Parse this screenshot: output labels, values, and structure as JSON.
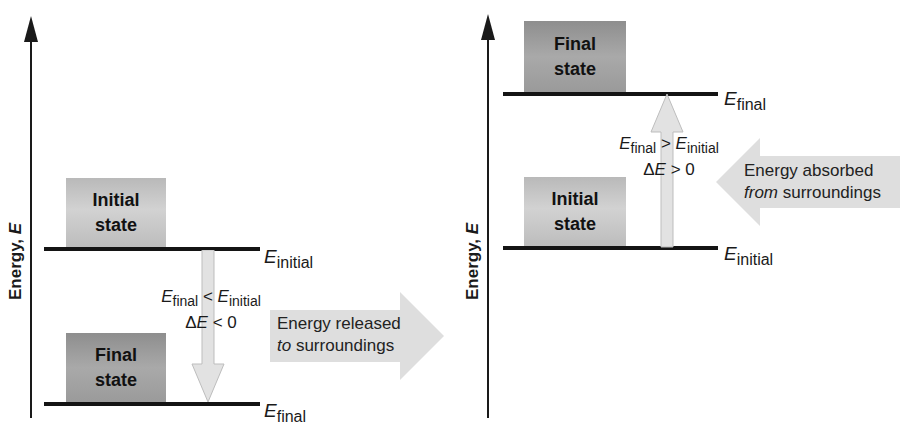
{
  "colors": {
    "axis": "#1a1a1a",
    "level_line": "#141414",
    "initial_box": "#c8c8c8",
    "final_box": "#a0a0a0",
    "transition_arrow_fill": "#e2e2e2",
    "transition_arrow_stroke": "#bdbdbd",
    "surroundings_arrow_fill": "#dedede"
  },
  "left_panel": {
    "axis_label_prefix": "Energy, ",
    "axis_label_symbol": "E",
    "initial_box": {
      "line1": "Initial",
      "line2": "state"
    },
    "final_box": {
      "line1": "Final",
      "line2": "state"
    },
    "initial_level": {
      "symbol": "E",
      "subscript": "initial"
    },
    "final_level": {
      "symbol": "E",
      "subscript": "final"
    },
    "relation": {
      "lhs_symbol": "E",
      "lhs_sub": "final",
      "operator": " < ",
      "rhs_symbol": "E",
      "rhs_sub": "initial",
      "delta_prefix": "Δ",
      "delta_symbol": "E",
      "delta_rest": " < 0"
    },
    "surroundings_arrow": {
      "direction": "right",
      "line1": "Energy released",
      "line2_italic": "to",
      "line2_rest": " surroundings"
    }
  },
  "right_panel": {
    "axis_label_prefix": "Energy, ",
    "axis_label_symbol": "E",
    "final_box": {
      "line1": "Final",
      "line2": "state"
    },
    "initial_box": {
      "line1": "Initial",
      "line2": "state"
    },
    "final_level": {
      "symbol": "E",
      "subscript": "final"
    },
    "initial_level": {
      "symbol": "E",
      "subscript": "initial"
    },
    "relation": {
      "lhs_symbol": "E",
      "lhs_sub": "final",
      "operator": " > ",
      "rhs_symbol": "E",
      "rhs_sub": "initial",
      "delta_prefix": "Δ",
      "delta_symbol": "E",
      "delta_rest": " > 0"
    },
    "surroundings_arrow": {
      "direction": "left",
      "line1": "Energy absorbed",
      "line2_italic": "from",
      "line2_rest": " surroundings"
    }
  }
}
